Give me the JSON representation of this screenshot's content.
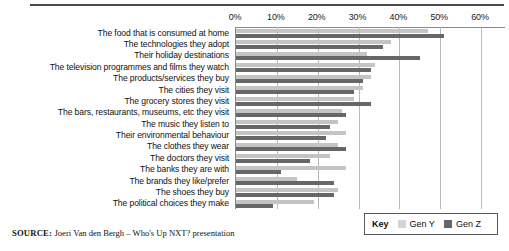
{
  "source": {
    "label": "SOURCE:",
    "text": "Joeri Van den Bergh – Who's Up NXT? presentation"
  },
  "legend": {
    "key_label": "Key",
    "entries": [
      {
        "name": "Gen Y",
        "color": "#d4d4d4"
      },
      {
        "name": "Gen Z",
        "color": "#676767"
      }
    ]
  },
  "chart_data": {
    "type": "bar",
    "orientation": "horizontal",
    "title": "",
    "subtitle": "",
    "xlabel": "",
    "ylabel": "",
    "xlim": [
      0,
      60
    ],
    "xtick_labels": [
      "0%",
      "10%",
      "20%",
      "30%",
      "40%",
      "50%",
      "60%"
    ],
    "xticks": [
      0,
      10,
      20,
      30,
      40,
      50,
      60
    ],
    "grid": true,
    "legend_position": "bottom-right",
    "categories": [
      "The food that is consumed at home",
      "The technologies they adopt",
      "Their holiday destinations",
      "The television programmes and films they watch",
      "The products/services they buy",
      "The cities they visit",
      "The grocery stores they visit",
      "The bars, restaurants, museums, etc they visit",
      "The music they listen to",
      "Their environmental behaviour",
      "The clothes they wear",
      "The doctors they visit",
      "The banks they are with",
      "The brands they like/prefer",
      "The shoes they buy",
      "The political choices they make"
    ],
    "series": [
      {
        "name": "Gen Y",
        "color": "#c4c4c4",
        "values": [
          47,
          38,
          32,
          34,
          33,
          31,
          29,
          26,
          25,
          27,
          25,
          23,
          27,
          15,
          25,
          19
        ]
      },
      {
        "name": "Gen Z",
        "color": "#676767",
        "values": [
          51,
          36,
          45,
          33,
          31,
          29,
          33,
          27,
          23,
          22,
          27,
          18,
          11,
          24,
          24,
          9
        ]
      }
    ]
  }
}
